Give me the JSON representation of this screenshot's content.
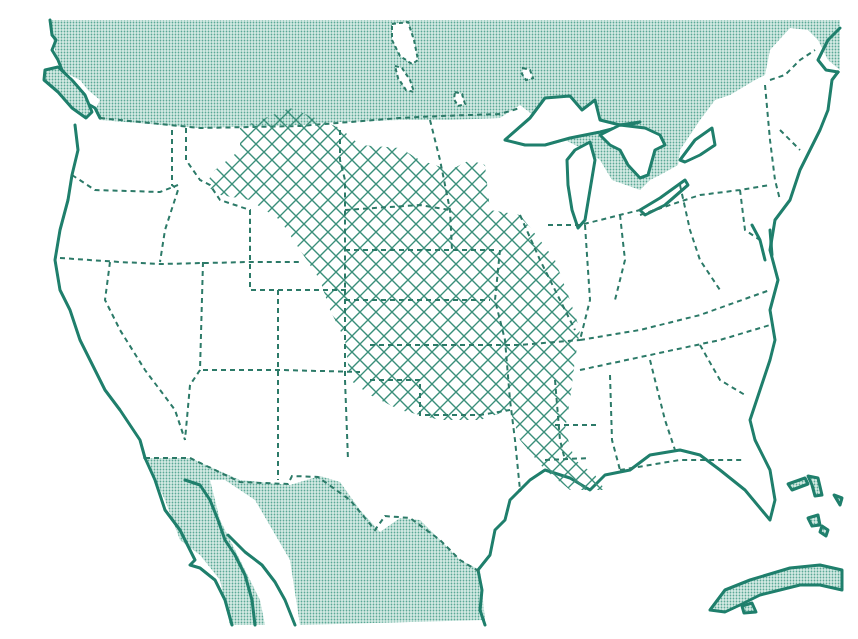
{
  "map": {
    "subject": "Contiguous United States with shaded region",
    "colors": {
      "ink": "#1f7f6c",
      "border": "#2c7a68",
      "dot_fill": "#8fc7b9",
      "background": "#ffffff"
    },
    "legend": {
      "hatched_region": "crosshatch-pattern",
      "foreign_land": "stipple-pattern"
    },
    "regions": [
      {
        "name": "canada",
        "style": "stipple"
      },
      {
        "name": "mexico",
        "style": "stipple"
      },
      {
        "name": "cuba",
        "style": "stipple"
      },
      {
        "name": "bahamas",
        "style": "stipple"
      },
      {
        "name": "central-plains-range",
        "style": "crosshatch"
      }
    ]
  }
}
